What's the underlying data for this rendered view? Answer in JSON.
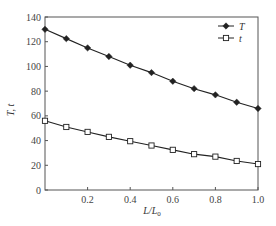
{
  "chart_data": {
    "type": "line",
    "title": "",
    "xlabel": "L/L0",
    "xlabel_main": "L/L",
    "xlabel_sub": "0",
    "ylabel": "T, t",
    "xlim": [
      0,
      1.0
    ],
    "ylim": [
      0,
      140
    ],
    "xticks": [
      0.2,
      0.4,
      0.6,
      0.8,
      1.0
    ],
    "xtick_labels": [
      "0.2",
      "0.4",
      "0.6",
      "0.8",
      "1.0"
    ],
    "yticks": [
      0,
      20,
      40,
      60,
      80,
      100,
      120,
      140
    ],
    "ytick_labels": [
      "0",
      "20",
      "40",
      "60",
      "80",
      "100",
      "120",
      "140"
    ],
    "grid": false,
    "legend_position": "upper right",
    "x": [
      0.0,
      0.1,
      0.2,
      0.3,
      0.4,
      0.5,
      0.6,
      0.7,
      0.8,
      0.9,
      1.0
    ],
    "series": [
      {
        "name": "T",
        "marker": "filled-diamond",
        "values": [
          130,
          122.5,
          115,
          108,
          101,
          95,
          88,
          82,
          77,
          71,
          66
        ]
      },
      {
        "name": "t",
        "marker": "open-square",
        "values": [
          56,
          51,
          47,
          43,
          39.5,
          36,
          32.5,
          29,
          27,
          23.5,
          21
        ]
      }
    ]
  },
  "colors": {
    "line": "#222222",
    "axis": "#555555",
    "background": "#ffffff"
  }
}
